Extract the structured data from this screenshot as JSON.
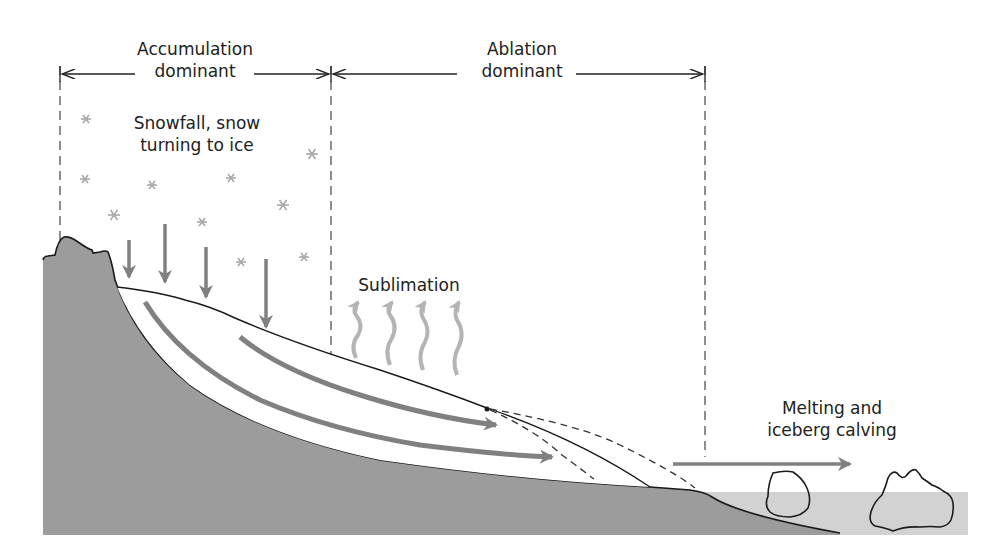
{
  "zones": {
    "accumulation": {
      "line1": "Accumulation",
      "line2": "dominant"
    },
    "ablation": {
      "line1": "Ablation",
      "line2": "dominant"
    }
  },
  "processes": {
    "snowfall": {
      "line1": "Snowfall, snow",
      "line2": "turning to ice"
    },
    "sublimation": {
      "label": "Sublimation"
    },
    "melting": {
      "line1": "Melting and",
      "line2": "iceberg calving"
    }
  },
  "colors": {
    "bedrock": "#9c9c9c",
    "water": "#d2d2d2",
    "arrow": "#808080",
    "sublimation_arrow": "#b4b4b4",
    "snowflake": "#a8a8a8",
    "ice": "#ffffff",
    "outline": "#1a1a1a"
  },
  "icons": {
    "snowflake": "snowflake-icon",
    "snowfall_arrow": "down-arrow-icon",
    "sublimation_arrow": "wavy-up-arrow-icon",
    "flow_arrow": "ice-flow-arrow-icon",
    "iceberg": "iceberg-icon"
  }
}
